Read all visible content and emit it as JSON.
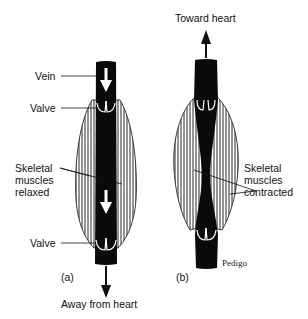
{
  "diagram": {
    "panels": [
      {
        "id": "a",
        "caption": "(a)",
        "labels": {
          "vein": "Vein",
          "valve_upper": "Valve",
          "muscles_line1": "Skeletal",
          "muscles_line2": "muscles",
          "muscles_line3": "relaxed",
          "valve_lower": "Valve",
          "direction": "Away from heart"
        }
      },
      {
        "id": "b",
        "caption": "(b)",
        "labels": {
          "direction": "Toward heart",
          "muscles_line1": "Skeletal",
          "muscles_line2": "muscles",
          "muscles_line3": "contracted",
          "signature": "Pedigo"
        }
      }
    ],
    "colors": {
      "vein_fill": "#0a0a0a",
      "line": "#111111",
      "background": "#ffffff"
    }
  }
}
